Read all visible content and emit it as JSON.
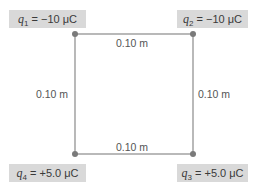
{
  "diagram": {
    "type": "square-charge-configuration",
    "charges": [
      {
        "id": "q1",
        "symbol": "q",
        "subscript": "1",
        "value": "= −10 μC",
        "position": "top-left"
      },
      {
        "id": "q2",
        "symbol": "q",
        "subscript": "2",
        "value": "= −10 μC",
        "position": "top-right"
      },
      {
        "id": "q3",
        "symbol": "q",
        "subscript": "3",
        "value": "= +5.0 μC",
        "position": "bottom-right"
      },
      {
        "id": "q4",
        "symbol": "q",
        "subscript": "4",
        "value": "= +5.0 μC",
        "position": "bottom-left"
      }
    ],
    "sides": {
      "top": "0.10 m",
      "bottom": "0.10 m",
      "left": "0.10 m",
      "right": "0.10 m"
    },
    "colors": {
      "line": "#8a8a8a",
      "dot": "#7a7a7a",
      "label_bg": "#d9d9d9"
    }
  }
}
